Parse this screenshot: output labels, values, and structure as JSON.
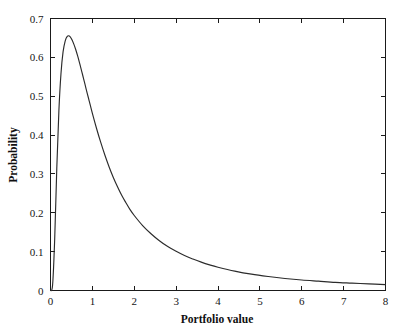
{
  "chart_data": {
    "type": "line",
    "title": "",
    "subtitle": "",
    "xlabel": "Portfolio value",
    "ylabel": "Probability",
    "xlim": [
      0,
      8
    ],
    "ylim": [
      0,
      0.7
    ],
    "grid": false,
    "legend": null,
    "legend_position": "none",
    "xticks": [
      0,
      1,
      2,
      3,
      4,
      5,
      6,
      7,
      8
    ],
    "xtick_labels": [
      "0",
      "1",
      "2",
      "3",
      "4",
      "5",
      "6",
      "7",
      "8"
    ],
    "yticks": [
      0,
      0.1,
      0.2,
      0.3,
      0.4,
      0.5,
      0.6,
      0.7
    ],
    "ytick_labels": [
      "0",
      "0.1",
      "0.2",
      "0.3",
      "0.4",
      "0.5",
      "0.6",
      "0.7"
    ],
    "line_color": "#2b2b2b",
    "annotations": [],
    "series": [
      {
        "name": "Portfolio value probability density",
        "x": [
          0.0,
          0.05,
          0.1,
          0.15,
          0.2,
          0.25,
          0.3,
          0.35,
          0.4,
          0.45,
          0.5,
          0.55,
          0.6,
          0.65,
          0.7,
          0.75,
          0.8,
          0.85,
          0.9,
          0.95,
          1.0,
          1.1,
          1.2,
          1.3,
          1.4,
          1.5,
          1.6,
          1.7,
          1.8,
          1.9,
          2.0,
          2.2,
          2.4,
          2.6,
          2.8,
          3.0,
          3.2,
          3.4,
          3.6,
          3.8,
          4.0,
          4.4,
          4.8,
          5.2,
          5.6,
          6.0,
          6.4,
          6.8,
          7.2,
          7.6,
          8.0
        ],
        "y": [
          0.0,
          0.014,
          0.132,
          0.314,
          0.462,
          0.558,
          0.614,
          0.642,
          0.654,
          0.655,
          0.648,
          0.636,
          0.621,
          0.603,
          0.583,
          0.562,
          0.541,
          0.519,
          0.498,
          0.477,
          0.456,
          0.417,
          0.381,
          0.348,
          0.318,
          0.291,
          0.267,
          0.245,
          0.226,
          0.208,
          0.193,
          0.167,
          0.146,
          0.128,
          0.113,
          0.101,
          0.09,
          0.081,
          0.073,
          0.066,
          0.06,
          0.05,
          0.042,
          0.036,
          0.031,
          0.027,
          0.024,
          0.021,
          0.019,
          0.017,
          0.015
        ]
      }
    ]
  },
  "axes": {
    "x_title": "Portfolio value",
    "y_title": "Probability"
  }
}
